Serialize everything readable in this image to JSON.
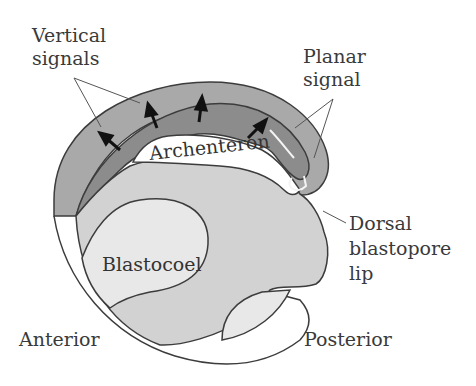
{
  "diagram": {
    "labels": {
      "vertical_signals": [
        "Vertical",
        "signals"
      ],
      "planar_signal": [
        "Planar",
        "signal"
      ],
      "archenteron": "Archenteron",
      "blastocoel": "Blastocoel",
      "dorsal_blastopore_lip": [
        "Dorsal",
        "blastopore",
        "lip"
      ],
      "anterior": "Anterior",
      "posterior": "Posterior"
    },
    "colors": {
      "outer_layer": "#a9a9a9",
      "inner_layer": "#8c8c8c",
      "endoderm": "#d2d2d2",
      "blastocoel": "#e8e8e8",
      "outline": "#3c3c3c",
      "background": "#ffffff"
    }
  }
}
